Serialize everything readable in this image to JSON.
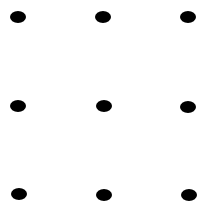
{
  "diagram": {
    "type": "dot-grid",
    "rows": 3,
    "cols": 3,
    "dot_color": "#000000",
    "background": "#ffffff",
    "dots": [
      {
        "row": 1,
        "col": 1,
        "x": 18,
        "y": 17
      },
      {
        "row": 1,
        "col": 2,
        "x": 103,
        "y": 17
      },
      {
        "row": 1,
        "col": 3,
        "x": 188,
        "y": 17
      },
      {
        "row": 2,
        "col": 1,
        "x": 18,
        "y": 106
      },
      {
        "row": 2,
        "col": 2,
        "x": 104,
        "y": 106
      },
      {
        "row": 2,
        "col": 3,
        "x": 188,
        "y": 107
      },
      {
        "row": 3,
        "col": 1,
        "x": 19,
        "y": 194
      },
      {
        "row": 3,
        "col": 2,
        "x": 104,
        "y": 195
      },
      {
        "row": 3,
        "col": 3,
        "x": 189,
        "y": 195
      }
    ]
  }
}
